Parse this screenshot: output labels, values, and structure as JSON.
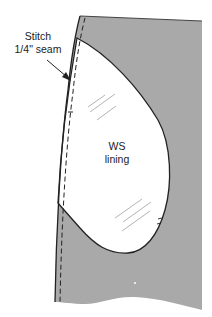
{
  "diagram": {
    "type": "sewing-instruction",
    "colors": {
      "fabric_fill": "#a9a9a9",
      "lining_fill": "#ffffff",
      "outline": "#333333",
      "hatch": "#9a9a9a"
    },
    "labels": {
      "stitch_line1": "Stitch",
      "stitch_line2": "1/4\" seam",
      "lining_line1": "WS",
      "lining_line2": "lining"
    }
  }
}
